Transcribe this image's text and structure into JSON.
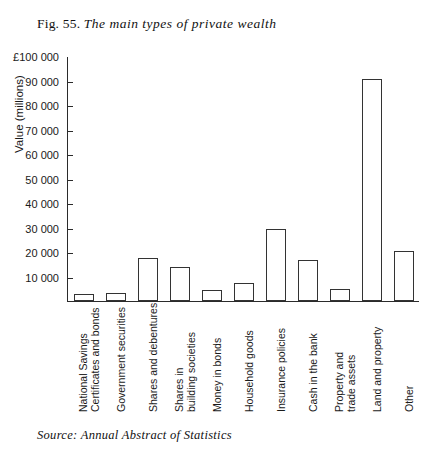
{
  "caption": {
    "fig_number": "Fig. 55.",
    "title": "The main types of private wealth"
  },
  "source": {
    "text": "Source: Annual Abstract of Statistics"
  },
  "chart_data": {
    "type": "bar",
    "title": "The main types of private wealth",
    "xlabel": "",
    "ylabel": "Value (millions)",
    "ylim": [
      0,
      100000
    ],
    "ytick_labels": [
      "£100 000",
      "90 000",
      "80 000",
      "70 000",
      "60 000",
      "50 000",
      "40 000",
      "30 000",
      "20 000",
      "10 000"
    ],
    "ytick_values": [
      100000,
      90000,
      80000,
      70000,
      60000,
      50000,
      40000,
      30000,
      20000,
      10000
    ],
    "grid": false,
    "legend": false,
    "bar_color": "#ffffff",
    "bar_edge_color": "#333333",
    "axis_color": "#2b2b2b",
    "categories": [
      "National Savings Certificates and bonds",
      "Government securities",
      "Shares and debentures",
      "Shares in building societies",
      "Money in bonds",
      "Household goods",
      "Insurance policies",
      "Cash in the bank",
      "Property and trade assets",
      "Land and property",
      "Other"
    ],
    "category_label_lines": [
      [
        "National Savings",
        "Certificates and bonds"
      ],
      [
        "Government securities"
      ],
      [
        "Shares and debentures"
      ],
      [
        "Shares in",
        "building societies"
      ],
      [
        "Money in bonds"
      ],
      [
        "Household goods"
      ],
      [
        "Insurance policies"
      ],
      [
        "Cash in the bank"
      ],
      [
        "Property and",
        "trade assets"
      ],
      [
        "Land and property"
      ],
      [
        "Other"
      ]
    ],
    "values": [
      3000,
      3200,
      17500,
      14000,
      4500,
      7500,
      29500,
      17000,
      5000,
      91000,
      20500
    ]
  }
}
